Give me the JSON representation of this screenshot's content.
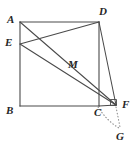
{
  "figure": {
    "width": 138,
    "height": 151,
    "background_color": "#ffffff",
    "stroke_color": "#4a4a4a",
    "dotted_color": "#8c8c8c",
    "label_color": "#262626",
    "points": [
      {
        "id": "A",
        "label": "A",
        "x": 20,
        "y": 22,
        "label_x": 7,
        "label_y": 14
      },
      {
        "id": "E",
        "label": "E",
        "x": 20,
        "y": 44,
        "label_x": 5,
        "label_y": 37
      },
      {
        "id": "B",
        "label": "B",
        "x": 20,
        "y": 106,
        "label_x": 6,
        "label_y": 105
      },
      {
        "id": "C",
        "label": "C",
        "x": 98,
        "y": 106,
        "label_x": 94,
        "label_y": 107
      },
      {
        "id": "D",
        "label": "D",
        "x": 99,
        "y": 22,
        "label_x": 99,
        "label_y": 6
      },
      {
        "id": "M",
        "label": "M",
        "x": 66,
        "y": 70,
        "label_x": 68,
        "label_y": 59
      },
      {
        "id": "F",
        "label": "F",
        "x": 116,
        "y": 105,
        "label_x": 122,
        "label_y": 99
      },
      {
        "id": "G",
        "label": "G",
        "x": 120,
        "y": 130,
        "label_x": 116,
        "label_y": 131
      }
    ],
    "solid_segments": [
      {
        "id": "AB",
        "from": "A",
        "to": "B"
      },
      {
        "id": "BC",
        "from": "B",
        "to": "C"
      },
      {
        "id": "CD",
        "from": "C",
        "to": "D"
      },
      {
        "id": "AD",
        "from": "A",
        "to": "D"
      },
      {
        "id": "ED",
        "from": "E",
        "to": "D"
      },
      {
        "id": "EF",
        "from": "E",
        "to": "F"
      },
      {
        "id": "AF",
        "from": "A",
        "to": "F"
      },
      {
        "id": "DF",
        "from": "D",
        "to": "F"
      },
      {
        "id": "CF",
        "from": "C",
        "to": "F"
      }
    ],
    "dotted_segments": [
      {
        "id": "FG",
        "from": "F",
        "to": "G",
        "kind": "line"
      },
      {
        "id": "CG",
        "from": "C",
        "to": "G",
        "kind": "arc"
      }
    ],
    "right_angle_marks": [
      {
        "id": "angle-at-F",
        "at": "F",
        "size": 6
      }
    ]
  }
}
